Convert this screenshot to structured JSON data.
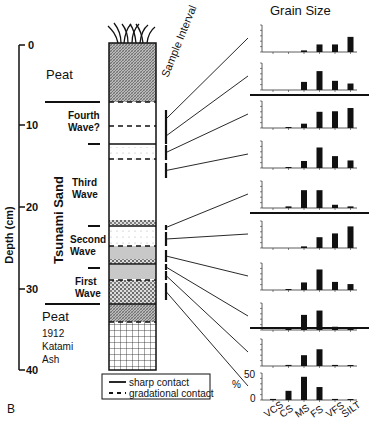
{
  "figure": {
    "panel_label": "B",
    "title": "Grain Size",
    "sample_interval_label": "Sample Interval",
    "depth_axis": {
      "label": "Depth (cm)",
      "ticks": [
        "0",
        "10",
        "20",
        "30",
        "40"
      ]
    },
    "tsunami_label": "Tsunami Sand",
    "units": [
      {
        "id": "peat-top",
        "label": "Peat"
      },
      {
        "id": "fourth",
        "label_line1": "Fourth",
        "label_line2": "Wave?"
      },
      {
        "id": "third",
        "label_line1": "Third",
        "label_line2": "Wave"
      },
      {
        "id": "second",
        "label_line1": "Second",
        "label_line2": "Wave"
      },
      {
        "id": "first",
        "label_line1": "First",
        "label_line2": "Wave"
      },
      {
        "id": "peat-bottom",
        "label": "Peat"
      },
      {
        "id": "ash",
        "label_line1": "1912",
        "label_line2": "Katami",
        "label_line3": "Ash"
      }
    ],
    "legend": {
      "sharp": "sharp contact",
      "gradational": "gradational contact"
    },
    "percent_axis": {
      "label": "%",
      "ticks": [
        "0",
        "50"
      ]
    }
  },
  "chart_data": {
    "type": "bar",
    "title": "Grain Size",
    "categories": [
      "VCS",
      "CS",
      "MS",
      "FS",
      "VFS",
      "SILT"
    ],
    "ylabel": "%",
    "ylim": [
      0,
      50
    ],
    "series": [
      {
        "name": "sample-1",
        "values": [
          0,
          0,
          3,
          14,
          14,
          28
        ]
      },
      {
        "name": "sample-2",
        "values": [
          0,
          0,
          15,
          35,
          17,
          12
        ]
      },
      {
        "name": "sample-3",
        "values": [
          0,
          1,
          8,
          30,
          31,
          37
        ]
      },
      {
        "name": "sample-4",
        "values": [
          0,
          1,
          13,
          38,
          22,
          14
        ]
      },
      {
        "name": "sample-5",
        "values": [
          0,
          3,
          33,
          33,
          6,
          3
        ]
      },
      {
        "name": "sample-6",
        "values": [
          0,
          0,
          3,
          20,
          27,
          40
        ]
      },
      {
        "name": "sample-7",
        "values": [
          0,
          1,
          14,
          38,
          15,
          11
        ]
      },
      {
        "name": "sample-8",
        "values": [
          0,
          3,
          28,
          36,
          6,
          5
        ]
      },
      {
        "name": "sample-9",
        "values": [
          0,
          2,
          20,
          31,
          2,
          1
        ]
      },
      {
        "name": "sample-10",
        "values": [
          2,
          17,
          43,
          24,
          2,
          1
        ]
      }
    ]
  }
}
